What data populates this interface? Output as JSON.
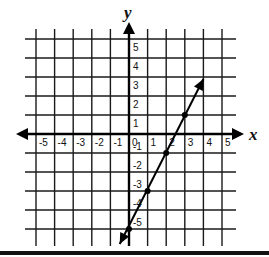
{
  "graph": {
    "x_axis_label": "x",
    "y_axis_label": "y",
    "x_ticks": [
      "-5",
      "-4",
      "-3",
      "-2",
      "-1",
      "0",
      "1",
      "2",
      "3",
      "4",
      "5"
    ],
    "y_ticks_positive": [
      "5",
      "4",
      "3",
      "2",
      "1"
    ],
    "y_ticks_negative": [
      "-1",
      "-2",
      "-3",
      "-4",
      "-5"
    ],
    "x_range": [
      -5,
      5
    ],
    "y_range": [
      -5,
      5
    ],
    "line": {
      "equation": "y = 2x - 5",
      "points": [
        [
          0,
          -5
        ],
        [
          1,
          -3
        ],
        [
          2,
          -1
        ],
        [
          3,
          1
        ]
      ],
      "arrow_ends": [
        [
          -0.5,
          -6
        ],
        [
          4,
          3
        ]
      ]
    },
    "colors": {
      "grid": "#1a1a1a",
      "line": "#000000",
      "background": "#ffffff"
    }
  }
}
